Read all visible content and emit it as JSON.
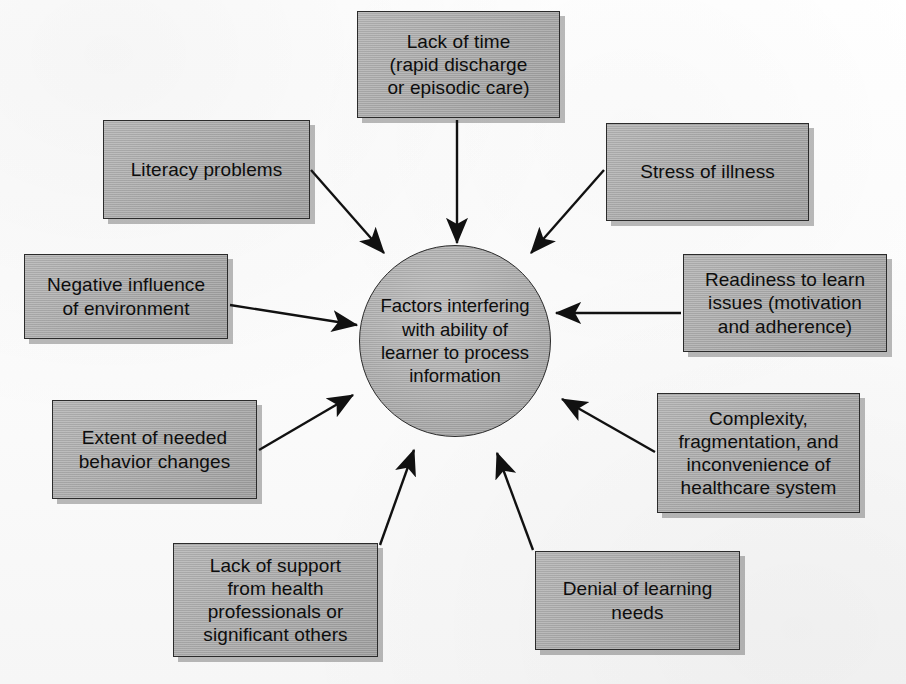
{
  "diagram": {
    "title": "Factors interfering with ability of learner to process information",
    "type": "radial-concept-map",
    "colors": {
      "box_fill": "#a9a9a9",
      "box_border": "#2b2b2b",
      "hub_fill": "#ababab",
      "arrow": "#111111",
      "page_background": "#fdfdfd",
      "shadow": "#1e1e1e"
    },
    "hub": {
      "label": "Factors interfering\nwith ability of\nlearner to process\ninformation",
      "cx": 455,
      "cy": 341,
      "r": 96
    },
    "nodes": [
      {
        "id": "lack-of-time",
        "label": "Lack of time\n(rapid discharge\nor episodic care)",
        "x": 357,
        "y": 11,
        "w": 203,
        "h": 107,
        "arrow": {
          "x1": 457,
          "y1": 120,
          "x2": 457,
          "y2": 243,
          "head": "down"
        }
      },
      {
        "id": "literacy-problems",
        "label": "Literacy problems",
        "x": 103,
        "y": 120,
        "w": 207,
        "h": 99,
        "arrow": {
          "x1": 311,
          "y1": 170,
          "x2": 384,
          "y2": 253,
          "head": "down-right"
        }
      },
      {
        "id": "stress-of-illness",
        "label": "Stress of illness",
        "x": 606,
        "y": 123,
        "w": 203,
        "h": 98,
        "arrow": {
          "x1": 604,
          "y1": 170,
          "x2": 531,
          "y2": 253,
          "head": "down-left"
        }
      },
      {
        "id": "negative-influence-of-environment",
        "label": "Negative influence\nof environment",
        "x": 24,
        "y": 254,
        "w": 204,
        "h": 85,
        "arrow": {
          "x1": 230,
          "y1": 305,
          "x2": 357,
          "y2": 325,
          "head": "right"
        }
      },
      {
        "id": "readiness-to-learn-issues",
        "label": "Readiness to learn\nissues (motivation\nand adherence)",
        "x": 683,
        "y": 254,
        "w": 204,
        "h": 98,
        "arrow": {
          "x1": 681,
          "y1": 313,
          "x2": 556,
          "y2": 313,
          "head": "left"
        }
      },
      {
        "id": "extent-of-needed-behavior-changes",
        "label": "Extent of needed\nbehavior changes",
        "x": 52,
        "y": 400,
        "w": 205,
        "h": 99,
        "arrow": {
          "x1": 259,
          "y1": 450,
          "x2": 353,
          "y2": 395,
          "head": "up-right"
        }
      },
      {
        "id": "complexity-fragmentation-inconvenience",
        "label": "Complexity,\nfragmentation, and\ninconvenience of\nhealthcare system",
        "x": 657,
        "y": 393,
        "w": 203,
        "h": 120,
        "arrow": {
          "x1": 655,
          "y1": 452,
          "x2": 562,
          "y2": 399,
          "head": "up-left"
        }
      },
      {
        "id": "lack-of-support",
        "label": "Lack of support\nfrom health\nprofessionals or\nsignificant others",
        "x": 173,
        "y": 543,
        "w": 205,
        "h": 114,
        "arrow": {
          "x1": 380,
          "y1": 545,
          "x2": 414,
          "y2": 450,
          "head": "up-right"
        }
      },
      {
        "id": "denial-of-learning-needs",
        "label": "Denial of learning\nneeds",
        "x": 535,
        "y": 551,
        "w": 205,
        "h": 99,
        "arrow": {
          "x1": 533,
          "y1": 550,
          "x2": 497,
          "y2": 453,
          "head": "up-left"
        }
      }
    ]
  }
}
